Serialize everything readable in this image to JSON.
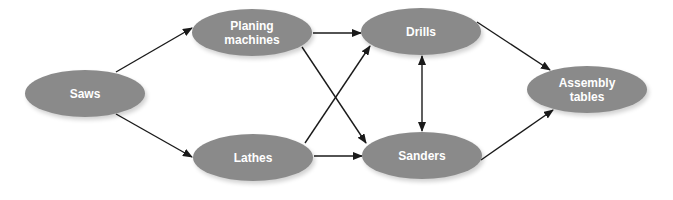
{
  "diagram": {
    "type": "network-flow",
    "node_color": "#8a8a8a",
    "edge_color": "#1a1a1a",
    "nodes": [
      {
        "id": "saws",
        "label": "Saws",
        "cx": 85,
        "cy": 93
      },
      {
        "id": "planing",
        "label": "Planing machines",
        "cx": 252,
        "cy": 32
      },
      {
        "id": "lathes",
        "label": "Lathes",
        "cx": 253,
        "cy": 157
      },
      {
        "id": "drills",
        "label": "Drills",
        "cx": 421,
        "cy": 31
      },
      {
        "id": "sanders",
        "label": "Sanders",
        "cx": 422,
        "cy": 155
      },
      {
        "id": "assembly",
        "label": "Assembly tables",
        "cx": 587,
        "cy": 89
      }
    ],
    "edges": [
      {
        "from": "saws",
        "to": "planing",
        "direction": "forward"
      },
      {
        "from": "saws",
        "to": "lathes",
        "direction": "forward"
      },
      {
        "from": "planing",
        "to": "drills",
        "direction": "forward"
      },
      {
        "from": "planing",
        "to": "sanders",
        "direction": "forward"
      },
      {
        "from": "lathes",
        "to": "drills",
        "direction": "forward"
      },
      {
        "from": "lathes",
        "to": "sanders",
        "direction": "forward"
      },
      {
        "from": "drills",
        "to": "sanders",
        "direction": "both"
      },
      {
        "from": "drills",
        "to": "assembly",
        "direction": "forward"
      },
      {
        "from": "sanders",
        "to": "assembly",
        "direction": "forward"
      }
    ]
  },
  "labels": {
    "saws": "Saws",
    "planing": "Planing machines",
    "lathes": "Lathes",
    "drills": "Drills",
    "sanders": "Sanders",
    "assembly": "Assembly tables"
  }
}
